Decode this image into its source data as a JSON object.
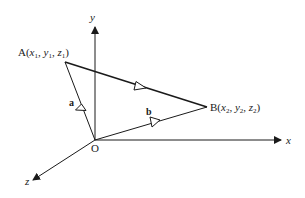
{
  "diagram": {
    "axes": {
      "x_label": "x",
      "y_label": "y",
      "z_label": "z",
      "origin_label": "O"
    },
    "points": {
      "A": {
        "name": "A",
        "coords": "(x1, y1, z1)",
        "display": [
          "A(",
          "x",
          "1",
          ", ",
          "y",
          "1",
          ", ",
          "z",
          "1",
          ")"
        ]
      },
      "B": {
        "name": "B",
        "coords": "(x2, y2, z2)",
        "display": [
          "B(",
          "x",
          "2",
          ", ",
          "y",
          "2",
          ", ",
          "z",
          "2",
          ")"
        ]
      }
    },
    "vectors": {
      "a": "a",
      "b": "b"
    },
    "colors": {
      "line": "#1a1a1a",
      "background": "#ffffff"
    }
  }
}
